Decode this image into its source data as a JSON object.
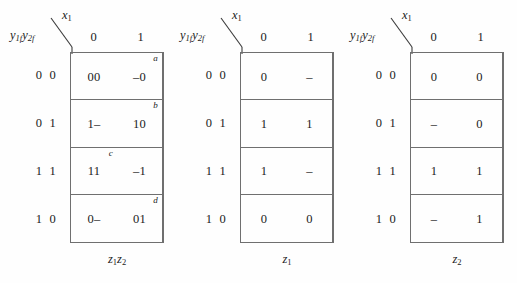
{
  "figure": {
    "type": "karnaugh-map-set",
    "map_count": 3
  },
  "common": {
    "row_header_label": "y1f y2f",
    "col_header_label": "x1",
    "column_headers": [
      "0",
      "1"
    ],
    "row_headers": [
      "0 0",
      "0 1",
      "1 1",
      "1 0"
    ],
    "line_color": "#6f6f6f",
    "text_color": "#1b1b1b",
    "background": "#fefefe"
  },
  "maps": [
    {
      "caption": "z1z2",
      "caption_plain": "z1z2",
      "rows": [
        {
          "label": "0 0",
          "cells": [
            {
              "value": "00",
              "tag": ""
            },
            {
              "value": "–0",
              "tag": "a"
            }
          ]
        },
        {
          "label": "0 1",
          "cells": [
            {
              "value": "1–",
              "tag": ""
            },
            {
              "value": "10",
              "tag": "b"
            }
          ]
        },
        {
          "label": "1 1",
          "cells": [
            {
              "value": "11",
              "tag": "c"
            },
            {
              "value": "–1",
              "tag": ""
            }
          ]
        },
        {
          "label": "1 0",
          "cells": [
            {
              "value": "0–",
              "tag": ""
            },
            {
              "value": "01",
              "tag": "d"
            }
          ]
        }
      ]
    },
    {
      "caption": "z1",
      "caption_plain": "z1",
      "rows": [
        {
          "label": "0 0",
          "cells": [
            {
              "value": "0",
              "tag": ""
            },
            {
              "value": "–",
              "tag": ""
            }
          ]
        },
        {
          "label": "0 1",
          "cells": [
            {
              "value": "1",
              "tag": ""
            },
            {
              "value": "1",
              "tag": ""
            }
          ]
        },
        {
          "label": "1 1",
          "cells": [
            {
              "value": "1",
              "tag": ""
            },
            {
              "value": "–",
              "tag": ""
            }
          ]
        },
        {
          "label": "1 0",
          "cells": [
            {
              "value": "0",
              "tag": ""
            },
            {
              "value": "0",
              "tag": ""
            }
          ]
        }
      ]
    },
    {
      "caption": "z2",
      "caption_plain": "z2",
      "rows": [
        {
          "label": "0 0",
          "cells": [
            {
              "value": "0",
              "tag": ""
            },
            {
              "value": "0",
              "tag": ""
            }
          ]
        },
        {
          "label": "0 1",
          "cells": [
            {
              "value": "–",
              "tag": ""
            },
            {
              "value": "0",
              "tag": ""
            }
          ]
        },
        {
          "label": "1 1",
          "cells": [
            {
              "value": "1",
              "tag": ""
            },
            {
              "value": "1",
              "tag": ""
            }
          ]
        },
        {
          "label": "1 0",
          "cells": [
            {
              "value": "–",
              "tag": ""
            },
            {
              "value": "1",
              "tag": ""
            }
          ]
        }
      ]
    }
  ]
}
